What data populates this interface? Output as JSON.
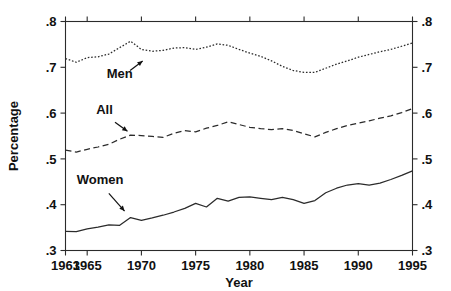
{
  "chart_data": {
    "type": "line",
    "title": "",
    "xlabel": "Year",
    "ylabel": "Percentage",
    "xlim": [
      1963,
      1995
    ],
    "ylim": [
      0.3,
      0.8
    ],
    "xticks": [
      1963,
      1965,
      1970,
      1975,
      1980,
      1985,
      1990,
      1995
    ],
    "xtick_labels": [
      "1963",
      "1965",
      "1970",
      "1975",
      "1980",
      "1985",
      "1990",
      "1995"
    ],
    "yticks": [
      0.3,
      0.4,
      0.5,
      0.6,
      0.7,
      0.8
    ],
    "ytick_labels": [
      ".3",
      ".4",
      ".5",
      ".6",
      ".7",
      ".8"
    ],
    "grid": false,
    "legend": "inline-annotations",
    "right_axis_mirrored": true,
    "right_ytick_labels": [
      ".3",
      ".4",
      ".5",
      ".6",
      ".7",
      ".8"
    ],
    "x": [
      1963,
      1964,
      1965,
      1966,
      1967,
      1968,
      1969,
      1970,
      1971,
      1972,
      1973,
      1974,
      1975,
      1976,
      1977,
      1978,
      1979,
      1980,
      1981,
      1982,
      1983,
      1984,
      1985,
      1986,
      1987,
      1988,
      1989,
      1990,
      1991,
      1992,
      1993,
      1994,
      1995
    ],
    "series": [
      {
        "name": "Men",
        "style": "dotted",
        "color": "#2b2b2b",
        "values": [
          0.719,
          0.711,
          0.721,
          0.723,
          0.729,
          0.743,
          0.757,
          0.739,
          0.735,
          0.737,
          0.742,
          0.743,
          0.739,
          0.744,
          0.751,
          0.748,
          0.739,
          0.731,
          0.724,
          0.714,
          0.702,
          0.693,
          0.689,
          0.689,
          0.698,
          0.707,
          0.714,
          0.722,
          0.728,
          0.734,
          0.739,
          0.746,
          0.753
        ]
      },
      {
        "name": "All",
        "style": "dashed",
        "color": "#2b2b2b",
        "values": [
          0.519,
          0.515,
          0.521,
          0.526,
          0.532,
          0.543,
          0.552,
          0.551,
          0.549,
          0.547,
          0.556,
          0.562,
          0.559,
          0.567,
          0.573,
          0.581,
          0.575,
          0.569,
          0.566,
          0.564,
          0.566,
          0.562,
          0.555,
          0.548,
          0.558,
          0.566,
          0.573,
          0.578,
          0.583,
          0.589,
          0.594,
          0.601,
          0.61
        ]
      },
      {
        "name": "Women",
        "style": "solid",
        "color": "#2b2b2b",
        "values": [
          0.342,
          0.341,
          0.347,
          0.351,
          0.356,
          0.355,
          0.372,
          0.366,
          0.371,
          0.377,
          0.384,
          0.392,
          0.403,
          0.395,
          0.414,
          0.408,
          0.416,
          0.417,
          0.414,
          0.411,
          0.416,
          0.411,
          0.403,
          0.409,
          0.426,
          0.436,
          0.443,
          0.446,
          0.443,
          0.447,
          0.455,
          0.464,
          0.474
        ]
      }
    ],
    "annotations": [
      {
        "text": "Men",
        "label_x": 1968.0,
        "label_y": 0.676,
        "point_x": 1970.3,
        "point_y": 0.717
      },
      {
        "text": "All",
        "label_x": 1966.6,
        "label_y": 0.597,
        "point_x": 1968.9,
        "point_y": 0.557
      },
      {
        "text": "Women",
        "label_x": 1966.2,
        "label_y": 0.446,
        "point_x": 1968.6,
        "point_y": 0.382
      }
    ]
  }
}
